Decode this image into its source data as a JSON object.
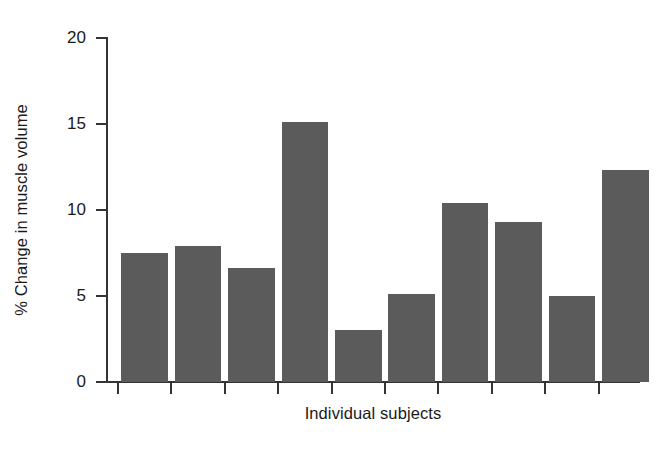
{
  "chart_data": {
    "type": "bar",
    "title": "",
    "subtitle": "",
    "xlabel": "Individual subjects",
    "ylabel": "% Change in muscle volume",
    "categories": [
      "1",
      "2",
      "3",
      "4",
      "5",
      "6",
      "7",
      "8",
      "9",
      "10"
    ],
    "values": [
      7.5,
      7.9,
      6.6,
      15.1,
      3.0,
      5.1,
      10.4,
      9.3,
      5.0,
      12.3
    ],
    "ylim": [
      0,
      20
    ],
    "yticks": [
      0,
      5,
      10,
      15,
      20
    ],
    "ytick_labels": [
      "0",
      "5",
      "10",
      "15",
      "20"
    ],
    "xtick_labels": [
      "",
      "",
      "",
      "",
      "",
      "",
      "",
      "",
      "",
      ""
    ],
    "grid": false,
    "legend": null,
    "bar_color": "#5b5b5b",
    "axis_color": "#343434",
    "background_color": "#ffffff",
    "text_color": "#1a1a1a"
  }
}
